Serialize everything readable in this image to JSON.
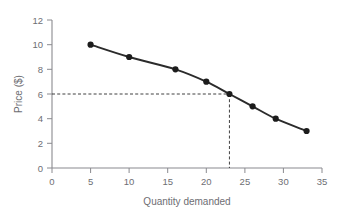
{
  "chart_data": {
    "type": "line",
    "title": "",
    "xlabel": "Quantity demanded",
    "ylabel": "Price ($)",
    "xlim": [
      0,
      35
    ],
    "ylim": [
      0,
      12
    ],
    "xticks": [
      0,
      5,
      10,
      15,
      20,
      25,
      30,
      35
    ],
    "yticks": [
      0,
      2,
      4,
      6,
      8,
      10,
      12
    ],
    "xtick_labels": [
      "0",
      "5",
      "10",
      "15",
      "20",
      "25",
      "30",
      "35"
    ],
    "ytick_labels": [
      "0",
      "2",
      "4",
      "6",
      "8",
      "10",
      "12"
    ],
    "grid": false,
    "legend": null,
    "series": [
      {
        "name": "Demand curve",
        "x": [
          5,
          10,
          16,
          20,
          23,
          26,
          29,
          33
        ],
        "y": [
          10,
          9,
          8,
          7,
          6,
          5,
          4,
          3
        ],
        "marker": "circle",
        "color": "#1c1c1c"
      }
    ],
    "annotations": [
      {
        "type": "guide-lines",
        "name": "price-quantity-guide",
        "x": 23,
        "y": 6,
        "style": "dashed",
        "description": "Dashed lines from price 6 on the y-axis to the curve and down to quantity 23 on the x-axis"
      }
    ],
    "colors": {
      "line": "#2b2b2b",
      "marker": "#1c1c1c",
      "axis": "#8a8a8f",
      "text": "#6e6e73",
      "guide": "#2b2b2b",
      "background": "#ffffff"
    }
  },
  "labels": {
    "x_axis_title": "Quantity demanded",
    "y_axis_title": "Price ($)"
  }
}
